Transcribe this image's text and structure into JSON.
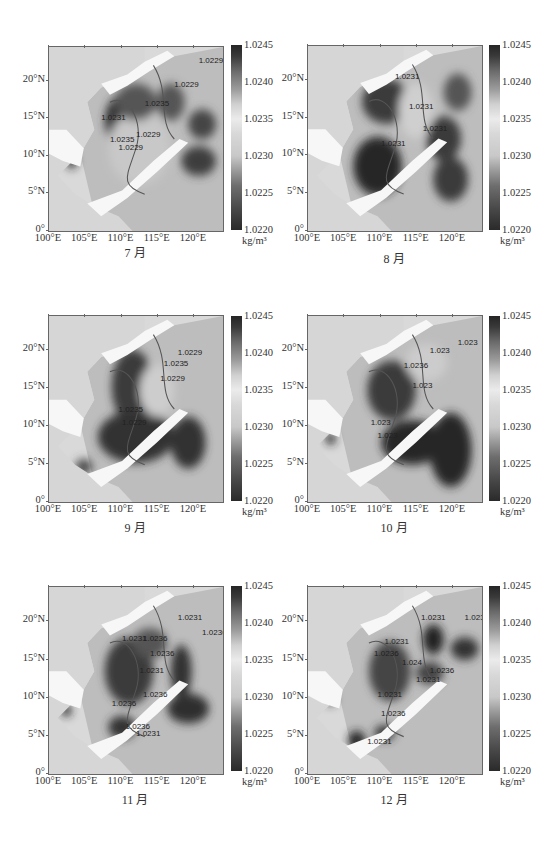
{
  "figure": {
    "colorbar": {
      "ticks": [
        "1.0245",
        "1.0240",
        "1.0235",
        "1.0230",
        "1.0225",
        "1.0220"
      ],
      "unit": "kg/m³",
      "range": [
        1.022,
        1.0245
      ]
    },
    "axes": {
      "yticks": [
        "20°N",
        "15°N",
        "10°N",
        "5°N",
        "0°"
      ],
      "xticks": [
        "100°E",
        "105°E",
        "110°E",
        "115°E",
        "120°E"
      ]
    },
    "panels": [
      {
        "caption": "7 月",
        "contour_labels": [
          "1.0229",
          "1.0235",
          "1.0229",
          "1.0229",
          "1.0235",
          "1.0229",
          "1.0231"
        ]
      },
      {
        "caption": "8 月",
        "contour_labels": [
          "1.0231",
          "1.0231",
          "1.0231",
          "1.0231"
        ]
      },
      {
        "caption": "9 月",
        "contour_labels": [
          "1.0229",
          "1.0235",
          "1.0229",
          "1.0235",
          "1.0229"
        ]
      },
      {
        "caption": "10 月",
        "contour_labels": [
          "1.023",
          "1.023",
          "1.0236",
          "1.023",
          "1.023",
          "1.023"
        ]
      },
      {
        "caption": "11 月",
        "contour_labels": [
          "1.0231",
          "1.0236",
          "1.0231",
          "1.0236",
          "1.0236",
          "1.0231",
          "1.0236",
          "1.0236",
          "1.0231",
          "1.0236"
        ]
      },
      {
        "caption": "12 月",
        "contour_labels": [
          "1.0231",
          "1.0231",
          "1.0231",
          "1.0236",
          "1.024",
          "1.0231",
          "1.0236",
          "1.0231",
          "1.0236",
          "1.0231"
        ]
      }
    ]
  },
  "chart_data": {
    "type": "heatmap",
    "xlabel": "Longitude",
    "ylabel": "Latitude",
    "xlim": [
      100,
      124
    ],
    "ylim": [
      0,
      24.5
    ],
    "x_ticks": [
      "100°E",
      "105°E",
      "110°E",
      "115°E",
      "120°E"
    ],
    "y_ticks": [
      "0°",
      "5°N",
      "10°N",
      "15°N",
      "20°N"
    ],
    "colorbar": {
      "min": 1.022,
      "max": 1.0245,
      "ticks": [
        1.022,
        1.0225,
        1.023,
        1.0235,
        1.024,
        1.0245
      ],
      "unit": "kg/m³",
      "colormap": "grayscale diverging (dark ends, light middle)"
    },
    "grid": false,
    "legend_position": "right (colorbar)",
    "panels": [
      {
        "month": "7 月",
        "contour_levels": [
          1.0229,
          1.0235,
          1.0231
        ],
        "note": "high density (dark) along Vietnam coast, low ~1.0229 central basin"
      },
      {
        "month": "8 月",
        "contour_levels": [
          1.0231
        ],
        "note": "dark high-density region west and south basin, 1.0231 contour through centre"
      },
      {
        "month": "9 月",
        "contour_levels": [
          1.0229,
          1.0235
        ],
        "note": "high density southern basin, low central tongue"
      },
      {
        "month": "10 月",
        "contour_levels": [
          1.023,
          1.0236
        ],
        "note": "strong dark south-east region, lighter north"
      },
      {
        "month": "11 月",
        "contour_levels": [
          1.0231,
          1.0236
        ],
        "note": "mixed dark eddies along western boundary"
      },
      {
        "month": "12 月",
        "contour_levels": [
          1.0231,
          1.0236,
          1.024
        ],
        "note": "central basin moderate, dark patches NE and south"
      }
    ]
  }
}
